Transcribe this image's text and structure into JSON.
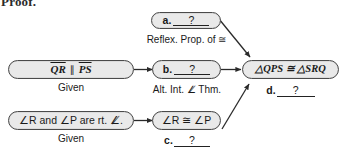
{
  "heading": "Proof.",
  "diagram": {
    "type": "flowchart-proof",
    "fill_color": "#e9e9e9",
    "outline_color": "#4a4a4a",
    "boxes": [
      {
        "id": "a",
        "position": "top-middle",
        "label_prefix": "a.",
        "label_blank": "?",
        "reason": "Reflex. Prop. of ≅"
      },
      {
        "id": "given-1",
        "position": "left-middle",
        "statement_left": "QR",
        "statement_symbol": "∥",
        "statement_right": "PS",
        "reason": "Given"
      },
      {
        "id": "b",
        "position": "center-middle",
        "label_prefix": "b.",
        "label_blank": "?",
        "reason": "Alt. Int. ∠̸ Thm."
      },
      {
        "id": "conclusion",
        "position": "right-middle",
        "statement": "△QPS ≅ △SRQ",
        "label_prefix": "d.",
        "label_blank": "?"
      },
      {
        "id": "given-2",
        "position": "left-bottom",
        "statement": "∠R and ∠P are rt. ∠̸.",
        "reason": "Given"
      },
      {
        "id": "c",
        "position": "center-bottom",
        "statement": "∠R ≅ ∠P",
        "label_prefix": "c.",
        "label_blank": "?"
      }
    ],
    "arrows": [
      {
        "from": "given-1",
        "to": "b",
        "style": "horizontal"
      },
      {
        "from": "b",
        "to": "conclusion",
        "style": "horizontal"
      },
      {
        "from": "a",
        "to": "conclusion",
        "style": "diagonal-down"
      },
      {
        "from": "given-2",
        "to": "c",
        "style": "horizontal"
      },
      {
        "from": "c",
        "to": "conclusion",
        "style": "diagonal-up"
      }
    ]
  }
}
